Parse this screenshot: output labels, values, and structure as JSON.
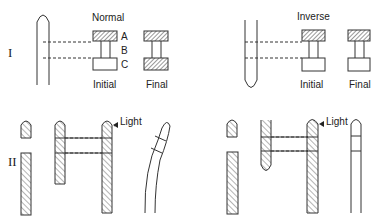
{
  "figure": {
    "rows": [
      {
        "id": "I",
        "label": "I"
      },
      {
        "id": "II",
        "label": "II"
      }
    ],
    "panel_normal": {
      "title": "Normal",
      "segment_labels": [
        "A",
        "B",
        "C"
      ],
      "state_labels": {
        "initial": "Initial",
        "final": "Final"
      }
    },
    "panel_inverse": {
      "title": "Inverse",
      "state_labels": {
        "initial": "Initial",
        "final": "Final"
      }
    },
    "light_label_left": "Light",
    "light_label_right": "Light"
  }
}
